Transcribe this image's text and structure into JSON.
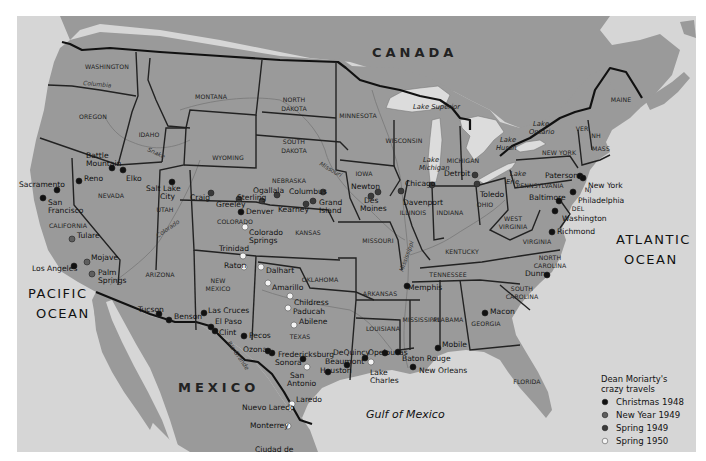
{
  "map": {
    "colors": {
      "land": "#9a9a9a",
      "water": "#d6d6d6",
      "border": "#111111",
      "christmas_1948": "#111111",
      "new_year_1949": "#5e5e5e",
      "spring_1949": "#3a3a3a",
      "spring_1950": "#f4f4f4"
    },
    "countries": [
      {
        "name": "CANADA",
        "x": 372,
        "y": 57
      },
      {
        "name": "MEXICO",
        "x": 178,
        "y": 392
      }
    ],
    "oceans": [
      {
        "lines": [
          "PACIFIC",
          "OCEAN"
        ],
        "x": 28,
        "y": 298
      },
      {
        "lines": [
          "ATLANTIC",
          "OCEAN"
        ],
        "x": 616,
        "y": 244
      }
    ],
    "gulf": {
      "name": "Gulf of Mexico",
      "x": 366,
      "y": 418
    },
    "states": [
      {
        "name": "WASHINGTON",
        "x": 107,
        "y": 69
      },
      {
        "name": "OREGON",
        "x": 93,
        "y": 119
      },
      {
        "name": "CALIFORNIA",
        "x": 68,
        "y": 228
      },
      {
        "name": "IDAHO",
        "x": 149,
        "y": 137
      },
      {
        "name": "NEVADA",
        "x": 111,
        "y": 198
      },
      {
        "name": "MONTANA",
        "x": 211,
        "y": 99
      },
      {
        "name": "WYOMING",
        "x": 228,
        "y": 160
      },
      {
        "name": "UTAH",
        "x": 165,
        "y": 212
      },
      {
        "name": "ARIZONA",
        "x": 160,
        "y": 277
      },
      {
        "name": "COLORADO",
        "x": 235,
        "y": 224
      },
      {
        "name": "NEW",
        "x": 218,
        "y": 283
      },
      {
        "name": "MEXICO",
        "x": 218,
        "y": 291
      },
      {
        "name": "NORTH",
        "x": 294,
        "y": 102
      },
      {
        "name": "DAKOTA",
        "x": 294,
        "y": 111
      },
      {
        "name": "SOUTH",
        "x": 294,
        "y": 144
      },
      {
        "name": "DAKOTA",
        "x": 294,
        "y": 153
      },
      {
        "name": "NEBRASKA",
        "x": 289,
        "y": 183
      },
      {
        "name": "KANSAS",
        "x": 308,
        "y": 235
      },
      {
        "name": "OKLAHOMA",
        "x": 320,
        "y": 282
      },
      {
        "name": "TEXAS",
        "x": 300,
        "y": 339
      },
      {
        "name": "MINNESOTA",
        "x": 358,
        "y": 118
      },
      {
        "name": "IOWA",
        "x": 364,
        "y": 176
      },
      {
        "name": "MISSOURI",
        "x": 378,
        "y": 243
      },
      {
        "name": "ARKANSAS",
        "x": 380,
        "y": 296
      },
      {
        "name": "LOUISIANA",
        "x": 383,
        "y": 331
      },
      {
        "name": "WISCONSIN",
        "x": 404,
        "y": 143
      },
      {
        "name": "ILLINOIS",
        "x": 413,
        "y": 215
      },
      {
        "name": "MISSISSIPPI",
        "x": 421,
        "y": 322
      },
      {
        "name": "MICHIGAN",
        "x": 463,
        "y": 163
      },
      {
        "name": "INDIANA",
        "x": 450,
        "y": 215
      },
      {
        "name": "KENTUCKY",
        "x": 462,
        "y": 254
      },
      {
        "name": "TENNESSEE",
        "x": 448,
        "y": 277
      },
      {
        "name": "ALABAMA",
        "x": 448,
        "y": 322
      },
      {
        "name": "OHIO",
        "x": 485,
        "y": 207
      },
      {
        "name": "GEORGIA",
        "x": 486,
        "y": 326
      },
      {
        "name": "FLORIDA",
        "x": 527,
        "y": 384
      },
      {
        "name": "WEST",
        "x": 513,
        "y": 221
      },
      {
        "name": "VIRGINIA",
        "x": 513,
        "y": 229
      },
      {
        "name": "VIRGINIA",
        "x": 537,
        "y": 244
      },
      {
        "name": "NORTH",
        "x": 550,
        "y": 260
      },
      {
        "name": "CAROLINA",
        "x": 550,
        "y": 268
      },
      {
        "name": "SOUTH",
        "x": 522,
        "y": 291
      },
      {
        "name": "CAROLINA",
        "x": 522,
        "y": 299
      },
      {
        "name": "PENNSYLVANIA",
        "x": 540,
        "y": 188
      },
      {
        "name": "NEW YORK",
        "x": 559,
        "y": 155
      },
      {
        "name": "VER",
        "x": 582,
        "y": 131
      },
      {
        "name": "NH",
        "x": 596,
        "y": 138
      },
      {
        "name": "MASS",
        "x": 601,
        "y": 151
      },
      {
        "name": "MAINE",
        "x": 621,
        "y": 102
      },
      {
        "name": "NJ",
        "x": 588,
        "y": 192
      },
      {
        "name": "DEL",
        "x": 578,
        "y": 211
      }
    ],
    "rivers": [
      {
        "name": "Columbia",
        "x": 83,
        "y": 85,
        "rotate": 5
      },
      {
        "name": "Snake",
        "x": 147,
        "y": 151,
        "rotate": 25
      },
      {
        "name": "Missouri",
        "x": 319,
        "y": 165,
        "rotate": 30
      },
      {
        "name": "Colorado",
        "x": 158,
        "y": 238,
        "rotate": -35
      },
      {
        "name": "Rio Grande",
        "x": 227,
        "y": 343,
        "rotate": 55
      },
      {
        "name": "Mississippi",
        "x": 403,
        "y": 272,
        "rotate": -70
      }
    ],
    "lakes": [
      {
        "lines": [
          "Lake Superior"
        ],
        "x": 413,
        "y": 109
      },
      {
        "lines": [
          "Lake",
          "Michigan"
        ],
        "x": 419,
        "y": 162
      },
      {
        "lines": [
          "Lake",
          "Huron"
        ],
        "x": 496,
        "y": 142
      },
      {
        "lines": [
          "Lake",
          "Ontario"
        ],
        "x": 529,
        "y": 126
      },
      {
        "lines": [
          "Lake",
          "Erie"
        ],
        "x": 506,
        "y": 176
      }
    ],
    "cities": [
      {
        "name": "Sacramento",
        "x": 57,
        "y": 190,
        "lx": 19,
        "ly": 187,
        "trip": "christmas_1948"
      },
      {
        "name": "San Francisco",
        "x": 43,
        "y": 198,
        "lx": 48,
        "ly": 205,
        "lx2": 48,
        "ly2": 213,
        "line1": "San",
        "line2": "Francisco",
        "trip": "christmas_1948"
      },
      {
        "name": "Reno",
        "x": 79,
        "y": 181,
        "lx": 84,
        "ly": 181,
        "trip": "christmas_1948"
      },
      {
        "name": "Battle Mountain",
        "x": 112,
        "y": 168,
        "lx": 86,
        "ly": 158,
        "lx2": 86,
        "ly2": 166,
        "line1": "Battle",
        "line2": "Mountain",
        "trip": "christmas_1948"
      },
      {
        "name": "Elko",
        "x": 123,
        "y": 170,
        "lx": 126,
        "ly": 181,
        "trip": "christmas_1948"
      },
      {
        "name": "Salt Lake City",
        "x": 172,
        "y": 182,
        "lx": 146,
        "ly": 191,
        "lx2": 160,
        "ly2": 199,
        "line1": "Salt Lake",
        "line2": "City",
        "trip": "christmas_1948"
      },
      {
        "name": "Tulare",
        "x": 72,
        "y": 239,
        "lx": 77,
        "ly": 238,
        "trip": "new_year_1949"
      },
      {
        "name": "Mojave",
        "x": 87,
        "y": 262,
        "lx": 91,
        "ly": 260,
        "trip": "new_year_1949"
      },
      {
        "name": "Los Angeles",
        "x": 74,
        "y": 266,
        "lx": 32,
        "ly": 271,
        "trip": "christmas_1948"
      },
      {
        "name": "Palm Springs",
        "x": 92,
        "y": 274,
        "lx": 98,
        "ly": 275,
        "lx2": 98,
        "ly2": 283,
        "line1": "Palm",
        "line2": "Springs",
        "trip": "new_year_1949"
      },
      {
        "name": "Craig",
        "x": 211,
        "y": 193,
        "lx": 190,
        "ly": 200,
        "trip": "spring_1949"
      },
      {
        "name": "Greeley",
        "x": 239,
        "y": 199,
        "lx": 216,
        "ly": 207,
        "trip": "spring_1949"
      },
      {
        "name": "Sterling",
        "x": 262,
        "y": 201,
        "lx": 237,
        "ly": 200,
        "trip": "spring_1949"
      },
      {
        "name": "Denver",
        "x": 241,
        "y": 212,
        "lx": 246,
        "ly": 214,
        "trip": "christmas_1948"
      },
      {
        "name": "Ogallala",
        "x": 277,
        "y": 195,
        "lx": 253,
        "ly": 193,
        "trip": "spring_1949"
      },
      {
        "name": "Kearney",
        "x": 306,
        "y": 204,
        "lx": 278,
        "ly": 212,
        "trip": "spring_1949"
      },
      {
        "name": "Columbus",
        "x": 323,
        "y": 192,
        "lx": 289,
        "ly": 194,
        "trip": "spring_1949"
      },
      {
        "name": "Grand Island",
        "x": 313,
        "y": 201,
        "lx": 319,
        "ly": 205,
        "lx2": 319,
        "ly2": 213,
        "line1": "Grand",
        "line2": "Island",
        "trip": "spring_1949"
      },
      {
        "name": "Newton",
        "x": 371,
        "y": 196,
        "lx": 351,
        "ly": 189,
        "trip": "spring_1949"
      },
      {
        "name": "Des Moines",
        "x": 378,
        "y": 192,
        "lx": 364,
        "ly": 203,
        "lx2": 360,
        "ly2": 211,
        "line1": "Des",
        "line2": "Moines",
        "trip": "spring_1949"
      },
      {
        "name": "Davenport",
        "x": 401,
        "y": 191,
        "lx": 403,
        "ly": 205,
        "trip": "spring_1949"
      },
      {
        "name": "Chicago",
        "x": 432,
        "y": 185,
        "lx": 405,
        "ly": 186,
        "trip": "spring_1949"
      },
      {
        "name": "Detroit",
        "x": 475,
        "y": 175,
        "lx": 444,
        "ly": 176,
        "trip": "spring_1949"
      },
      {
        "name": "Toledo",
        "x": 477,
        "y": 184,
        "lx": 480,
        "ly": 197,
        "trip": "spring_1949"
      },
      {
        "name": "Paterson",
        "x": 580,
        "y": 176,
        "lx": 545,
        "ly": 178,
        "trip": "christmas_1948"
      },
      {
        "name": "New York",
        "x": 583,
        "y": 178,
        "lx": 588,
        "ly": 188,
        "trip": "christmas_1948"
      },
      {
        "name": "Philadelphia",
        "x": 573,
        "y": 192,
        "lx": 578,
        "ly": 203,
        "trip": "christmas_1948"
      },
      {
        "name": "Baltimore",
        "x": 559,
        "y": 201,
        "lx": 529,
        "ly": 200,
        "trip": "christmas_1948"
      },
      {
        "name": "Washington",
        "x": 555,
        "y": 211,
        "lx": 562,
        "ly": 221,
        "trip": "christmas_1948"
      },
      {
        "name": "Richmond",
        "x": 552,
        "y": 232,
        "lx": 557,
        "ly": 234,
        "trip": "christmas_1948"
      },
      {
        "name": "Dunn",
        "x": 547,
        "y": 275,
        "lx": 525,
        "ly": 276,
        "trip": "christmas_1948"
      },
      {
        "name": "Macon",
        "x": 485,
        "y": 313,
        "lx": 490,
        "ly": 314,
        "trip": "christmas_1948"
      },
      {
        "name": "Mobile",
        "x": 438,
        "y": 348,
        "lx": 442,
        "ly": 347,
        "trip": "christmas_1948"
      },
      {
        "name": "Memphis",
        "x": 407,
        "y": 286,
        "lx": 408,
        "ly": 290,
        "trip": "christmas_1948"
      },
      {
        "name": "New Orleans",
        "x": 413,
        "y": 367,
        "lx": 419,
        "ly": 373,
        "trip": "christmas_1948"
      },
      {
        "name": "Baton Rouge",
        "x": 398,
        "y": 352,
        "lx": 402,
        "ly": 361,
        "trip": "christmas_1948"
      },
      {
        "name": "Opelousas",
        "x": 385,
        "y": 353,
        "lx": 368,
        "ly": 355,
        "trip": "christmas_1948"
      },
      {
        "name": "Lake Charles",
        "x": 371,
        "y": 362,
        "lx": 370,
        "ly": 375,
        "lx2": 370,
        "ly2": 383,
        "line1": "Lake",
        "line2": "Charles",
        "trip": "spring_1950"
      },
      {
        "name": "DeQuincy",
        "x": 365,
        "y": 358,
        "lx": 333,
        "ly": 355,
        "trip": "christmas_1948"
      },
      {
        "name": "Beaumont",
        "x": 347,
        "y": 365,
        "lx": 325,
        "ly": 364,
        "trip": "christmas_1948"
      },
      {
        "name": "Houston",
        "x": 328,
        "y": 372,
        "lx": 320,
        "ly": 373,
        "trip": "christmas_1948"
      },
      {
        "name": "Dalhart",
        "x": 261,
        "y": 267,
        "lx": 266,
        "ly": 273,
        "trip": "spring_1950"
      },
      {
        "name": "Amarillo",
        "x": 268,
        "y": 283,
        "lx": 272,
        "ly": 290,
        "trip": "spring_1950"
      },
      {
        "name": "Childress",
        "x": 290,
        "y": 296,
        "lx": 294,
        "ly": 305,
        "trip": "spring_1950"
      },
      {
        "name": "Paducah",
        "x": 288,
        "y": 308,
        "lx": 293,
        "ly": 314,
        "trip": "spring_1950"
      },
      {
        "name": "Abilene",
        "x": 294,
        "y": 325,
        "lx": 299,
        "ly": 324,
        "trip": "spring_1950"
      },
      {
        "name": "San Antonio",
        "x": 307,
        "y": 367,
        "lx": 290,
        "ly": 378,
        "lx2": 287,
        "ly2": 386,
        "line1": "San",
        "line2": "Antonio",
        "trip": "spring_1950"
      },
      {
        "name": "Sonora",
        "x": 303,
        "y": 359,
        "lx": 275,
        "ly": 365,
        "trip": "christmas_1948"
      },
      {
        "name": "Fredericksburg",
        "x": 272,
        "y": 353,
        "lx": 278,
        "ly": 357,
        "trip": "christmas_1948"
      },
      {
        "name": "Ozona",
        "x": 268,
        "y": 351,
        "lx": 243,
        "ly": 352,
        "trip": "christmas_1948"
      },
      {
        "name": "Pecos",
        "x": 244,
        "y": 336,
        "lx": 249,
        "ly": 338,
        "trip": "christmas_1948"
      },
      {
        "name": "Clint",
        "x": 215,
        "y": 331,
        "lx": 219,
        "ly": 335,
        "trip": "christmas_1948"
      },
      {
        "name": "El Paso",
        "x": 211,
        "y": 327,
        "lx": 215,
        "ly": 324,
        "trip": "christmas_1948"
      },
      {
        "name": "Las Cruces",
        "x": 204,
        "y": 313,
        "lx": 208,
        "ly": 313,
        "trip": "christmas_1948"
      },
      {
        "name": "Benson",
        "x": 169,
        "y": 320,
        "lx": 174,
        "ly": 319,
        "trip": "christmas_1948"
      },
      {
        "name": "Tucson",
        "x": 159,
        "y": 314,
        "lx": 138,
        "ly": 312,
        "trip": "christmas_1948"
      },
      {
        "name": "Raton",
        "x": 244,
        "y": 267,
        "lx": 224,
        "ly": 268,
        "trip": "spring_1950"
      },
      {
        "name": "Trinidad",
        "x": 243,
        "y": 256,
        "lx": 219,
        "ly": 251,
        "trip": "spring_1950"
      },
      {
        "name": "Colorado Springs",
        "x": 245,
        "y": 227,
        "lx": 249,
        "ly": 235,
        "lx2": 249,
        "ly2": 243,
        "line1": "Colorado",
        "line2": "Springs",
        "trip": "spring_1950"
      },
      {
        "name": "Laredo",
        "x": 292,
        "y": 404,
        "lx": 296,
        "ly": 402,
        "trip": "spring_1950"
      },
      {
        "name": "Nuevo Laredo",
        "x": 290,
        "y": 408,
        "lx": 242,
        "ly": 410,
        "trip": "spring_1950"
      },
      {
        "name": "Monterrey",
        "x": 288,
        "y": 426,
        "lx": 250,
        "ly": 428,
        "trip": "spring_1950"
      },
      {
        "name": "Ciudad de",
        "x": 0,
        "y": 0,
        "lx": 255,
        "ly": 452,
        "trip": "none",
        "label_only": true
      }
    ],
    "legend": {
      "title_line1": "Dean Moriarty's",
      "title_line2": "crazy travels",
      "items": [
        {
          "label": "Christmas 1948",
          "key": "christmas_1948"
        },
        {
          "label": "New Year 1949",
          "key": "new_year_1949"
        },
        {
          "label": "Spring 1949",
          "key": "spring_1949"
        },
        {
          "label": "Spring 1950",
          "key": "spring_1950"
        }
      ]
    }
  }
}
